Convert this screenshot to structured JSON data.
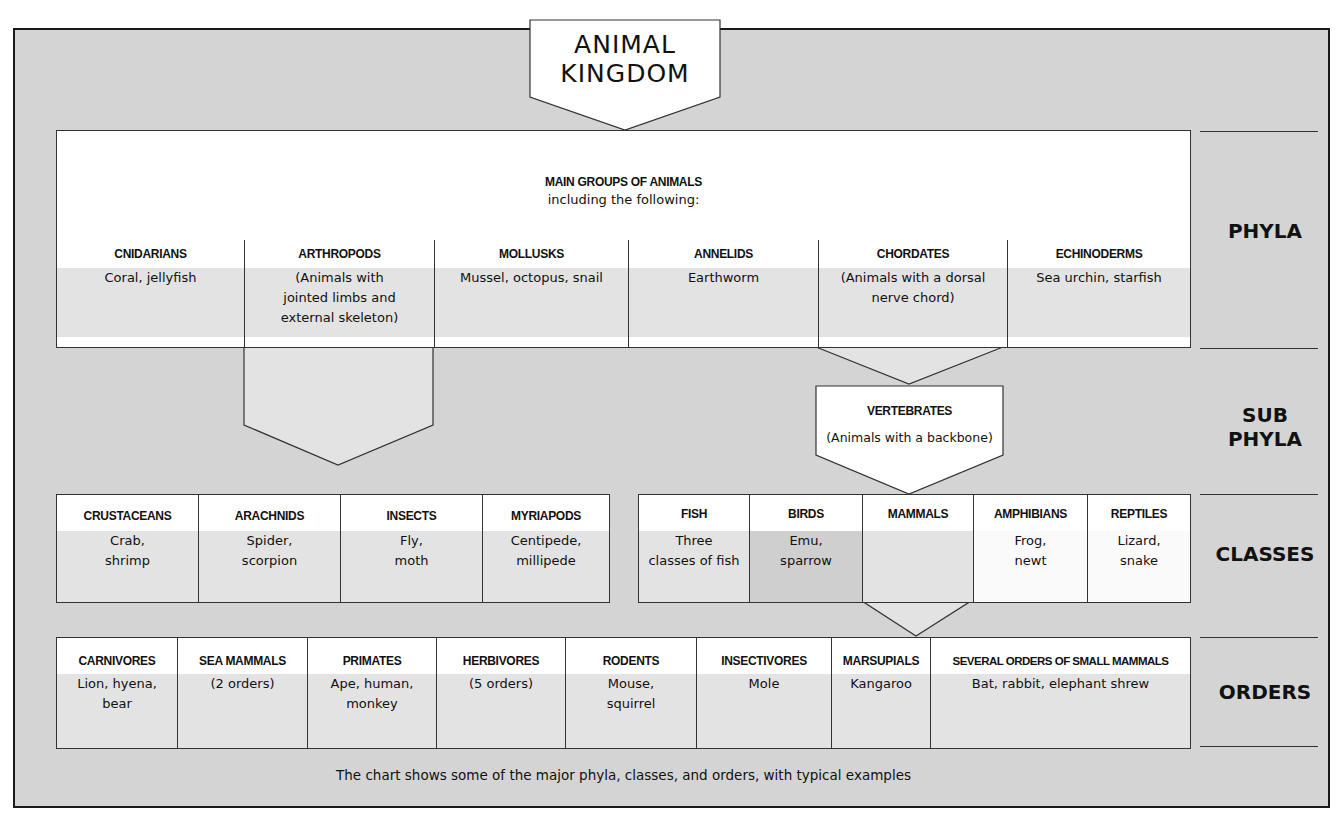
{
  "title": [
    "ANIMAL",
    "KINGDOM"
  ],
  "main_groups": {
    "heading": "MAIN GROUPS OF ANIMALS",
    "subheading": "including the following:"
  },
  "ranks": {
    "phyla": "PHYLA",
    "subphyla_1": "SUB",
    "subphyla_2": "PHYLA",
    "classes": "CLASSES",
    "orders": "ORDERS"
  },
  "phyla": [
    {
      "name": "CNIDARIANS",
      "examples": [
        "Coral, jellyfish"
      ]
    },
    {
      "name": "ARTHROPODS",
      "examples": [
        "(Animals with",
        "jointed limbs and",
        "external skeleton)"
      ]
    },
    {
      "name": "MOLLUSKS",
      "examples": [
        "Mussel, octopus, snail"
      ]
    },
    {
      "name": "ANNELIDS",
      "examples": [
        "Earthworm"
      ]
    },
    {
      "name": "CHORDATES",
      "examples": [
        "(Animals with a dorsal",
        "nerve chord)"
      ]
    },
    {
      "name": "ECHINODERMS",
      "examples": [
        "Sea urchin, starfish"
      ]
    }
  ],
  "subphylum": {
    "name": "VERTEBRATES",
    "description": "(Animals with a backbone)"
  },
  "arthropod_classes": [
    {
      "name": "CRUSTACEANS",
      "examples": [
        "Crab,",
        "shrimp"
      ]
    },
    {
      "name": "ARACHNIDS",
      "examples": [
        "Spider,",
        "scorpion"
      ]
    },
    {
      "name": "INSECTS",
      "examples": [
        "Fly,",
        "moth"
      ]
    },
    {
      "name": "MYRIAPODS",
      "examples": [
        "Centipede,",
        "millipede"
      ]
    }
  ],
  "vertebrate_classes": [
    {
      "name": "FISH",
      "examples": [
        "Three",
        "classes of fish"
      ]
    },
    {
      "name": "BIRDS",
      "examples": [
        "Emu,",
        "sparrow"
      ]
    },
    {
      "name": "MAMMALS",
      "examples": []
    },
    {
      "name": "AMPHIBIANS",
      "examples": [
        "Frog,",
        "newt"
      ]
    },
    {
      "name": "REPTILES",
      "examples": [
        "Lizard,",
        "snake"
      ]
    }
  ],
  "mammal_orders": [
    {
      "name": "CARNIVORES",
      "examples": [
        "Lion, hyena,",
        "bear"
      ]
    },
    {
      "name": "SEA MAMMALS",
      "examples": [
        "(2 orders)"
      ]
    },
    {
      "name": "PRIMATES",
      "examples": [
        "Ape, human,",
        "monkey"
      ]
    },
    {
      "name": "HERBIVORES",
      "examples": [
        "(5 orders)"
      ]
    },
    {
      "name": "RODENTS",
      "examples": [
        "Mouse,",
        "squirrel"
      ]
    },
    {
      "name": "INSECTIVORES",
      "examples": [
        "Mole"
      ]
    },
    {
      "name": "MARSUPIALS",
      "examples": [
        "Kangaroo"
      ]
    },
    {
      "name": "SEVERAL ORDERS OF SMALL MAMMALS",
      "examples": [
        "Bat, rabbit, elephant shrew"
      ]
    }
  ],
  "caption": "The chart shows some of the major phyla, classes, and orders, with typical examples",
  "colors": {
    "background": "#d4d4d4",
    "box": "#ffffff",
    "cell_fill": "#e3e3e3",
    "birds_fill": "#cfcfcf",
    "line": "#333333"
  }
}
